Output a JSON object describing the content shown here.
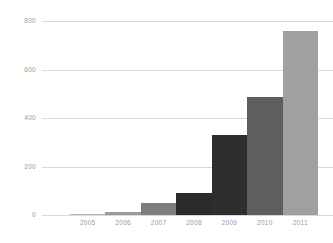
{
  "chart_data": {
    "type": "bar",
    "title": "",
    "subtitle": "",
    "xlabel": "",
    "ylabel": "",
    "categories": [
      "2005",
      "2006",
      "2007",
      "2008",
      "2009",
      "2010",
      "2011"
    ],
    "values": [
      5,
      12,
      50,
      92,
      330,
      487,
      758
    ],
    "series": [
      {
        "name": "",
        "values": [
          5,
          12,
          50,
          92,
          330,
          487,
          758
        ]
      }
    ],
    "bar_colors": [
      "#b4b4b4",
      "#9a9a9a",
      "#7d7d7d",
      "#2b2b2b",
      "#2e2e2e",
      "#5e5e5e",
      "#a0a0a0"
    ],
    "ylim": [
      0,
      800
    ],
    "yticks": [
      0,
      200,
      400,
      600,
      800
    ],
    "ytick_labels": [
      "0",
      "200",
      "400",
      "600",
      "800"
    ],
    "xtick_labels": [
      "2005",
      "2006",
      "2007",
      "2008",
      "2009",
      "2010",
      "2011"
    ],
    "grid": true,
    "grid_axis": "y",
    "grid_color": "#d8d8d8",
    "legend": false,
    "legend_position": "none",
    "background_color": "#ffffff",
    "tick_label_color": "#9a9a9a",
    "annotations": []
  }
}
